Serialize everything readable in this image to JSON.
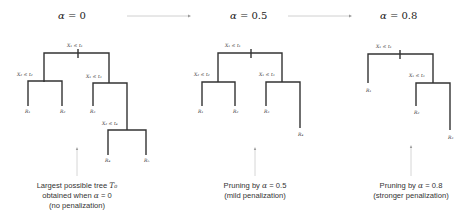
{
  "headers": [
    {
      "symbol": "α",
      "eq": " = 0"
    },
    {
      "symbol": "α",
      "eq": " = 0.5"
    },
    {
      "symbol": "α",
      "eq": " = 0.8"
    }
  ],
  "trees": [
    {
      "splits": [
        "X₁ ≤ t₁",
        "X₂ ≤ t₂",
        "X₁ ≤ t₃",
        "X₂ ≤ t₄"
      ],
      "leaves": [
        "R₁",
        "R₂",
        "R₃",
        "R₄",
        "R₅"
      ]
    },
    {
      "splits": [
        "X₁ ≤ t₁",
        "X₂ ≤ t₂",
        "X₁ ≤ t₃"
      ],
      "leaves": [
        "R₁",
        "R₂",
        "R₃",
        "R₄"
      ]
    },
    {
      "splits": [
        "X₁ ≤ t₁",
        "X₁ ≤ t₃"
      ],
      "leaves": [
        "R₁",
        "R₂",
        "R₃"
      ]
    }
  ],
  "captions": [
    {
      "line1_prefix": "Largest possible tree ",
      "line1_math": "T₀",
      "line2_prefix": "obtained when ",
      "line2_math": "α",
      "line2_suffix": " = 0",
      "line3": "(no penalization)"
    },
    {
      "line1_prefix": "Pruning by ",
      "line1_math": "α",
      "line1_suffix": " = 0.5",
      "line2": "(mild penalization)"
    },
    {
      "line1_prefix": "Pruning by ",
      "line1_math": "α",
      "line1_suffix": " = 0.8",
      "line2": "(stronger penalization)"
    }
  ],
  "colors": {
    "branch": "#333333",
    "arrow": "#bbbbbb"
  }
}
